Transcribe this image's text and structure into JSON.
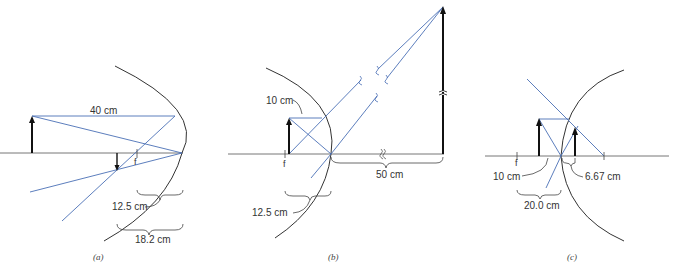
{
  "figure": {
    "colors": {
      "ray": "#4a6fb5",
      "axis": "#666666",
      "mirror": "#333333",
      "arrow": "#111111",
      "text": "#333333"
    },
    "panels": [
      {
        "id": "a",
        "caption": "(a)",
        "labels": {
          "object_distance": "40 cm",
          "focal_mark": "f",
          "focal_length": "12.5 cm",
          "image_distance": "18.2 cm"
        }
      },
      {
        "id": "b",
        "caption": "(b)",
        "labels": {
          "object_distance": "10 cm",
          "focal_mark": "f",
          "focal_length": "12.5 cm",
          "image_distance": "50 cm"
        }
      },
      {
        "id": "c",
        "caption": "(c)",
        "labels": {
          "object_distance": "10 cm",
          "focal_mark": "f",
          "focal_length": "20.0 cm",
          "image_distance": "6.67 cm"
        }
      }
    ]
  }
}
